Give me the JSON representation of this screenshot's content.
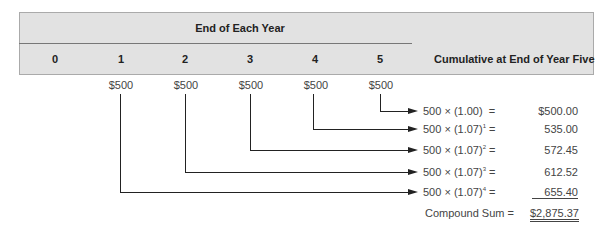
{
  "header": {
    "group_title": "End of Each Year",
    "years": [
      "0",
      "1",
      "2",
      "3",
      "4",
      "5"
    ],
    "cumulative_label": "Cumulative at End of Year Five"
  },
  "cash_flows": [
    "$500",
    "$500",
    "$500",
    "$500",
    "$500"
  ],
  "rows": [
    {
      "base": "500 × (1.00)",
      "exp": "",
      "eq": " =",
      "value": "$500.00"
    },
    {
      "base": "500 × (1.07)",
      "exp": "1",
      "eq": " =",
      "value": "535.00"
    },
    {
      "base": "500 × (1.07)",
      "exp": "2",
      "eq": " =",
      "value": "572.45"
    },
    {
      "base": "500 × (1.07)",
      "exp": "3",
      "eq": " =",
      "value": "612.52"
    },
    {
      "base": "500 × (1.07)",
      "exp": "4",
      "eq": " =",
      "value": "655.40"
    }
  ],
  "total": {
    "label": "Compound Sum =",
    "value": "$2,875.37"
  }
}
